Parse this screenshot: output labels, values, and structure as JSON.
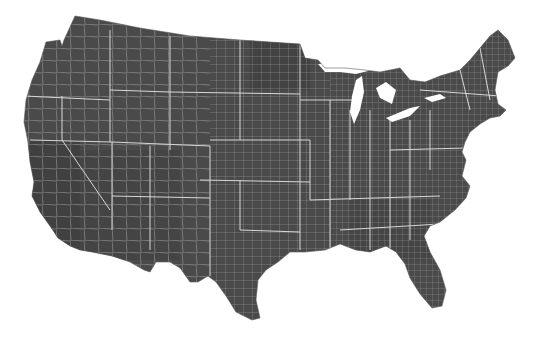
{
  "map": {
    "title": "",
    "region": "Contiguous United States",
    "granularity": "county",
    "colors": {
      "background": "#ffffff",
      "land": "#4a4a4a",
      "land_dark": "#3a3a3a",
      "land_mid": "#555555",
      "county_border": "#9a9a9a",
      "state_border": "#d8d8d8",
      "water": "#ffffff"
    }
  }
}
